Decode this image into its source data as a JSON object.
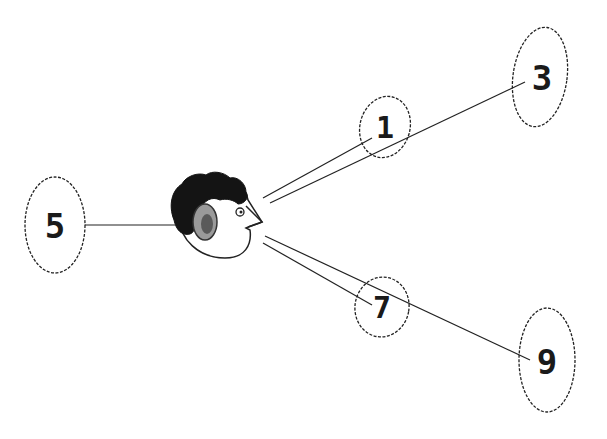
{
  "diagram": {
    "center": {
      "label": "listener-head",
      "x": 215,
      "y": 215
    },
    "nodes": [
      {
        "id": "n1",
        "label": "1",
        "cx": 385,
        "cy": 127,
        "rx": 25,
        "ry": 31
      },
      {
        "id": "n3",
        "label": "3",
        "cx": 540,
        "cy": 77,
        "rx": 27,
        "ry": 50
      },
      {
        "id": "n5",
        "label": "5",
        "cx": 55,
        "cy": 225,
        "rx": 30,
        "ry": 48
      },
      {
        "id": "n7",
        "label": "7",
        "cx": 382,
        "cy": 307,
        "rx": 27,
        "ry": 30
      },
      {
        "id": "n9",
        "label": "9",
        "cx": 547,
        "cy": 360,
        "rx": 28,
        "ry": 52
      }
    ],
    "edges": [
      {
        "from": "head",
        "to": "1"
      },
      {
        "from": "head",
        "to": "3"
      },
      {
        "from": "head",
        "to": "5"
      },
      {
        "from": "head",
        "to": "7"
      },
      {
        "from": "head",
        "to": "9"
      }
    ],
    "colors": {
      "stroke": "#222222",
      "hair": "#141414",
      "ear": "#8a8a8a"
    }
  }
}
